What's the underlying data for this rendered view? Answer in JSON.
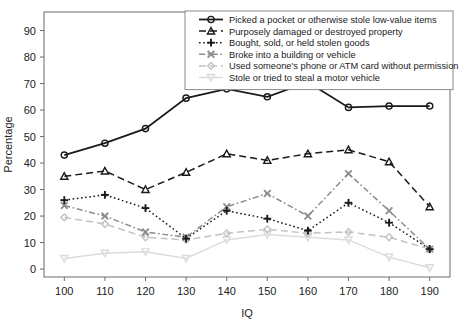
{
  "chart_data": {
    "type": "line",
    "title": "",
    "xlabel": "IQ",
    "ylabel": "Percentage",
    "x": [
      100,
      110,
      120,
      130,
      140,
      150,
      160,
      170,
      180,
      190
    ],
    "xtick_labels": [
      "100",
      "110",
      "120",
      "130",
      "140",
      "150",
      "160",
      "170",
      "180",
      "190"
    ],
    "ytick_labels": [
      "0",
      "10",
      "20",
      "30",
      "40",
      "50",
      "60",
      "70",
      "80",
      "90"
    ],
    "ytick_values": [
      0,
      10,
      20,
      30,
      40,
      50,
      60,
      70,
      80,
      90
    ],
    "xlim": [
      95,
      195
    ],
    "ylim": [
      -3,
      97
    ],
    "grid": false,
    "legend_position": "top-right",
    "series": [
      {
        "name": "Picked a pocket or otherwise stole low-value items",
        "marker": "circle",
        "dash": "solid",
        "color": "#1a1a1a",
        "values": [
          43,
          47.5,
          53,
          64.5,
          68,
          65,
          70.5,
          61,
          61.5,
          61.5
        ]
      },
      {
        "name": "Purposely damaged or destroyed property",
        "marker": "triangle",
        "dash": "dashed",
        "color": "#1a1a1a",
        "values": [
          35,
          37,
          30,
          36.5,
          43.5,
          41,
          43.5,
          45,
          40.5,
          23.5
        ]
      },
      {
        "name": "Bought, sold, or held stolen goods",
        "marker": "plus",
        "dash": "dotted",
        "color": "#1a1a1a",
        "values": [
          26,
          28,
          23,
          11.5,
          22,
          19,
          14.5,
          25,
          17.5,
          7.5
        ]
      },
      {
        "name": "Broke into a building or vehicle",
        "marker": "x",
        "dash": "dashdot",
        "color": "#8c8c8c",
        "values": [
          24,
          20,
          14,
          12,
          23.5,
          28.5,
          20,
          36,
          22,
          7.5
        ]
      },
      {
        "name": "Used someone's phone or ATM card without permission",
        "marker": "diamond",
        "dash": "dashed",
        "color": "#c2c2c2",
        "values": [
          19.5,
          17,
          12,
          11,
          13.5,
          15,
          13.5,
          14,
          12,
          7.5
        ]
      },
      {
        "name": "Stole or tried to steal a motor vehicle",
        "marker": "triangle-down",
        "dash": "solid",
        "color": "#dcdcdc",
        "values": [
          4,
          6,
          6.5,
          4,
          11,
          13,
          12,
          11,
          4.5,
          0.5
        ]
      }
    ]
  },
  "legend": {
    "items": [
      "Picked a pocket or otherwise stole low-value items",
      "Purposely damaged or destroyed property",
      "Bought, sold, or held stolen goods",
      "Broke into a building or vehicle",
      "Used someone's phone or ATM card without permission",
      "Stole or tried to steal a motor vehicle"
    ]
  },
  "axes": {
    "y_title": "Percentage",
    "x_title": "IQ"
  }
}
